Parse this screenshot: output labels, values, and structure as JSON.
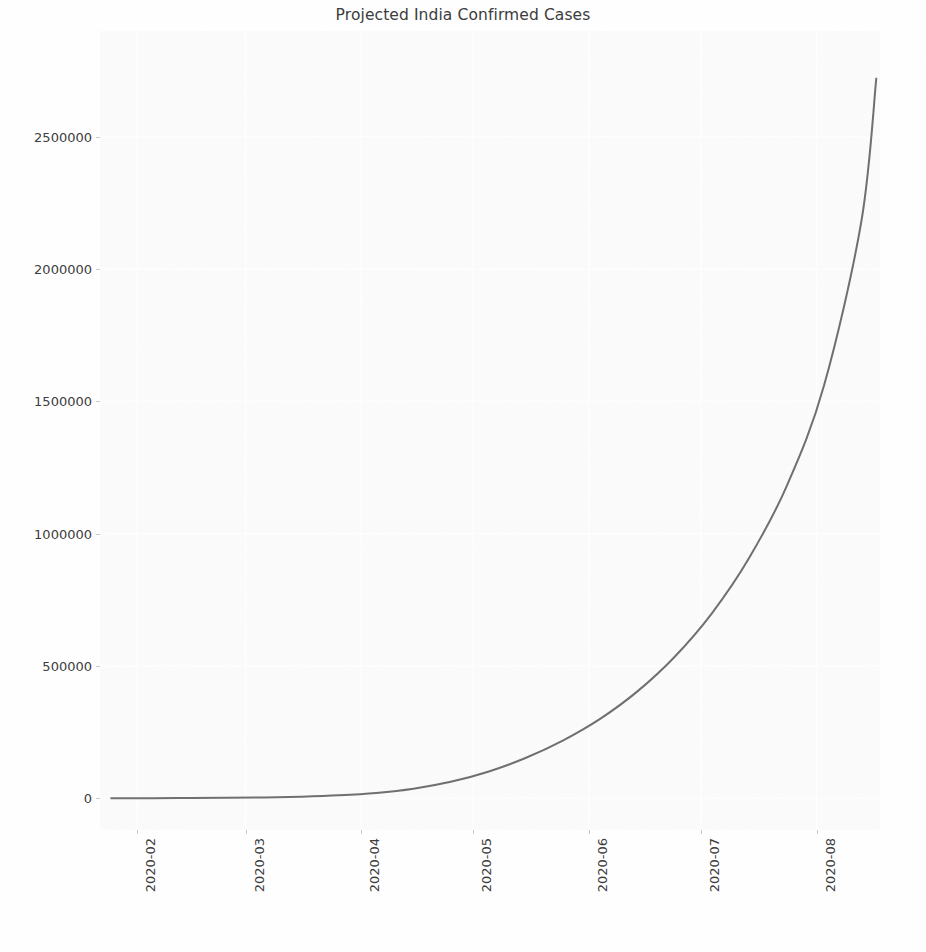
{
  "chart_data": {
    "type": "line",
    "title": "Projected India Confirmed Cases",
    "xlabel": "",
    "ylabel": "",
    "grid": true,
    "legend": null,
    "line_color": "#6f6f6f",
    "line_width": 2.0,
    "plot_background": "#fbfbfc",
    "figure_background": "#ffffff",
    "xlim": [
      "2020-01-22",
      "2020-08-18"
    ],
    "ylim": [
      -120000,
      2900000
    ],
    "yticks": [
      0,
      500000,
      1000000,
      1500000,
      2000000,
      2500000
    ],
    "ytick_labels": [
      "0",
      "500000",
      "1000000",
      "1500000",
      "2000000",
      "2500000"
    ],
    "xticks": [
      "2020-02",
      "2020-03",
      "2020-04",
      "2020-05",
      "2020-06",
      "2020-07",
      "2020-08"
    ],
    "xtick_labels": [
      "2020-02",
      "2020-03",
      "2020-04",
      "2020-05",
      "2020-06",
      "2020-07",
      "2020-08"
    ],
    "xtick_rotation": 90,
    "series": [
      {
        "name": "Projected Confirmed Cases",
        "x": [
          "2020-01-25",
          "2020-02-05",
          "2020-02-15",
          "2020-02-25",
          "2020-03-06",
          "2020-03-16",
          "2020-03-26",
          "2020-04-05",
          "2020-04-15",
          "2020-04-25",
          "2020-05-05",
          "2020-05-15",
          "2020-05-25",
          "2020-06-04",
          "2020-06-14",
          "2020-06-24",
          "2020-07-04",
          "2020-07-14",
          "2020-07-24",
          "2020-08-03",
          "2020-08-13",
          "2020-08-17"
        ],
        "values": [
          200,
          400,
          800,
          1600,
          3200,
          6000,
          11000,
          20000,
          36000,
          62000,
          100000,
          152000,
          218000,
          300000,
          404000,
          535000,
          700000,
          910000,
          1180000,
          1560000,
          2180000,
          2720000
        ]
      }
    ],
    "annotations": []
  }
}
